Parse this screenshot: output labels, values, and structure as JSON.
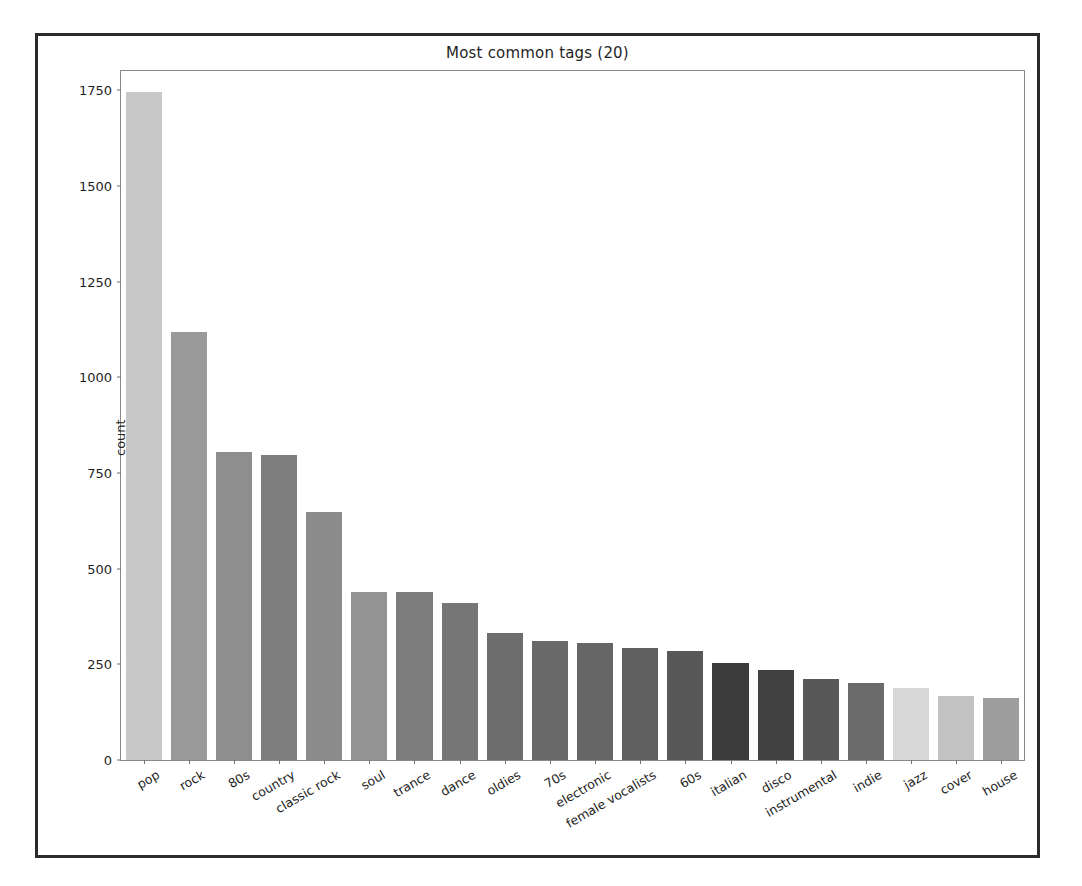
{
  "chart_data": {
    "type": "bar",
    "title": "Most common tags (20)",
    "xlabel": "",
    "ylabel": "count",
    "ylim": [
      0,
      1800
    ],
    "yticks": [
      0,
      250,
      500,
      750,
      1000,
      1250,
      1500,
      1750
    ],
    "grid": false,
    "legend": null,
    "categories": [
      "pop",
      "rock",
      "80s",
      "country",
      "classic rock",
      "soul",
      "trance",
      "dance",
      "oldies",
      "70s",
      "electronic",
      "female vocalists",
      "60s",
      "italian",
      "disco",
      "instrumental",
      "indie",
      "jazz",
      "cover",
      "house"
    ],
    "values": [
      1745,
      1117,
      804,
      798,
      647,
      440,
      438,
      409,
      331,
      311,
      307,
      292,
      284,
      253,
      236,
      211,
      201,
      188,
      168,
      162
    ],
    "bar_colors": [
      "#c8c8c8",
      "#9a9a9a",
      "#8e8e8e",
      "#7e7e7e",
      "#8b8b8b",
      "#939393",
      "#7c7c7c",
      "#767676",
      "#6d6d6d",
      "#6a6a6a",
      "#666666",
      "#5f5f5f",
      "#575757",
      "#3c3c3c",
      "#404040",
      "#585858",
      "#6b6b6b",
      "#d8d8d8",
      "#c2c2c2",
      "#9e9e9e"
    ]
  },
  "figure": {
    "background_color": "#ffffff",
    "frame_color": "#2b2b2b",
    "axes_edge_color": "#8a8a8a"
  }
}
